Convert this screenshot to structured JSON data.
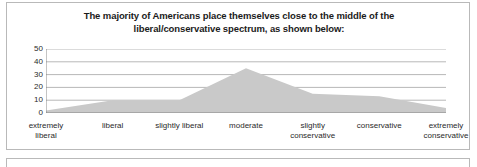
{
  "panel": {
    "title_line1": "The majority of Americans place themselves close to the middle of the",
    "title_line2": "liberal/conservative spectrum, as shown below:"
  },
  "chart_data": {
    "type": "area",
    "title": "The majority of Americans place themselves close to the middle of the liberal/conservative spectrum, as shown below:",
    "categories": [
      "extremely liberal",
      "liberal",
      "slightly liberal",
      "moderate",
      "slightly conservative",
      "conservative",
      "extremely conservative"
    ],
    "category_lines": [
      [
        "extremely",
        "liberal"
      ],
      [
        "liberal",
        ""
      ],
      [
        "slightly liberal",
        ""
      ],
      [
        "moderate",
        ""
      ],
      [
        "slightly",
        "conservative"
      ],
      [
        "conservative",
        ""
      ],
      [
        "extremely",
        "conservative"
      ]
    ],
    "values": [
      2,
      10,
      10,
      35,
      15,
      13,
      4
    ],
    "xlabel": "",
    "ylabel": "",
    "ylim": [
      0,
      50
    ],
    "yticks": [
      50,
      40,
      30,
      20,
      10,
      0
    ],
    "grid": true,
    "legend": false,
    "fill_color": "#c9c9c9",
    "grid_color": "#9a9a9a",
    "axis_color": "#7d7d7d"
  }
}
